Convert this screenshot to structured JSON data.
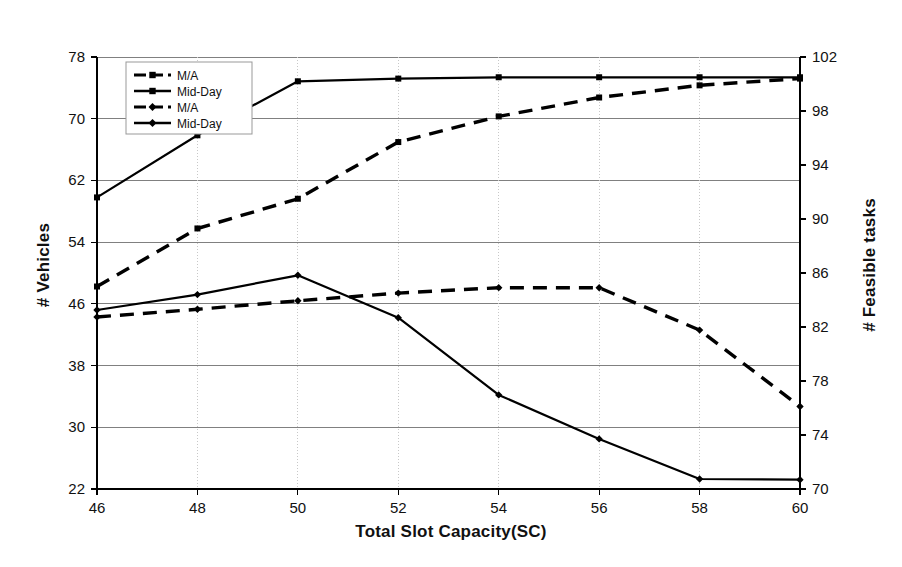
{
  "chart_data": {
    "type": "line",
    "title": "",
    "xlabel": "Total Slot Capacity(SC)",
    "ylabel": "# Vehicles",
    "ylabel_right": "# Feasible tasks",
    "x": [
      46,
      48,
      50,
      52,
      54,
      56,
      58,
      60
    ],
    "xlim": [
      46,
      60
    ],
    "xticks": [
      46,
      48,
      50,
      52,
      54,
      56,
      58,
      60
    ],
    "ylim": [
      22,
      78
    ],
    "yticks": [
      22,
      30,
      38,
      46,
      54,
      62,
      70,
      78
    ],
    "ylim_right": [
      70,
      102
    ],
    "yticks_right": [
      70,
      74,
      78,
      82,
      86,
      90,
      94,
      98,
      102
    ],
    "grid": true,
    "legend_position": "top-left",
    "series": [
      {
        "name": "M/A",
        "axis": "right",
        "group": "feasible-tasks",
        "style": "dashed",
        "marker": "square",
        "values": [
          85.0,
          89.3,
          91.5,
          95.7,
          97.6,
          99.0,
          99.9,
          100.4
        ]
      },
      {
        "name": "Mid-Day",
        "axis": "right",
        "group": "feasible-tasks",
        "style": "solid",
        "marker": "square",
        "values": [
          91.6,
          96.2,
          100.2,
          100.4,
          100.5,
          100.5,
          100.5,
          100.5
        ]
      },
      {
        "name": "M/A",
        "axis": "left",
        "group": "vehicles",
        "style": "dashed",
        "marker": "diamond",
        "values": [
          44.3,
          45.3,
          46.4,
          47.4,
          48.1,
          48.1,
          42.6,
          32.7
        ]
      },
      {
        "name": "Mid-Day",
        "axis": "left",
        "group": "vehicles",
        "style": "solid",
        "marker": "diamond",
        "values": [
          45.2,
          47.2,
          49.7,
          44.2,
          34.2,
          28.5,
          23.3,
          23.2
        ]
      }
    ],
    "legend": [
      {
        "label": "M/A",
        "style": "dashed",
        "marker": "square"
      },
      {
        "label": "Mid-Day",
        "style": "solid",
        "marker": "square"
      },
      {
        "label": "M/A",
        "style": "dashed",
        "marker": "diamond"
      },
      {
        "label": "Mid-Day",
        "style": "solid",
        "marker": "diamond"
      }
    ],
    "colors": {
      "line": "#000000",
      "grid": "#808080",
      "axis": "#000000",
      "background": "#ffffff"
    }
  }
}
